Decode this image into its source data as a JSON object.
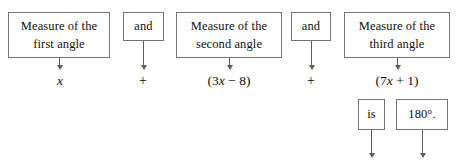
{
  "diagram": {
    "width": 464,
    "height": 162,
    "background_color": "#ffffff",
    "border_color": "#767676",
    "text_color": "#111111",
    "arrow_color": "#5d5d5d"
  },
  "boxes": [
    {
      "id": "first-angle",
      "line1": "Measure of the",
      "line2": "first angle",
      "x": 8,
      "y": 12,
      "w": 102,
      "h": 46
    },
    {
      "id": "and-1",
      "line1": "and",
      "line2": "",
      "x": 123,
      "y": 12,
      "w": 41,
      "h": 29
    },
    {
      "id": "second-angle",
      "line1": "Measure of the",
      "line2": "second angle",
      "x": 176,
      "y": 12,
      "w": 106,
      "h": 46
    },
    {
      "id": "and-2",
      "line1": "and",
      "line2": "",
      "x": 291,
      "y": 12,
      "w": 40,
      "h": 29
    },
    {
      "id": "third-angle",
      "line1": "Measure of the",
      "line2": "third angle",
      "x": 344,
      "y": 12,
      "w": 106,
      "h": 46
    },
    {
      "id": "is",
      "line1": "is",
      "line2": "",
      "x": 358,
      "y": 99,
      "w": 27,
      "h": 31
    },
    {
      "id": "one-eighty",
      "line1": "180°.",
      "line2": "",
      "x": 396,
      "y": 99,
      "w": 52,
      "h": 31
    }
  ],
  "expressions": [
    {
      "id": "x-term",
      "text": "x",
      "italic_html": "<span class=\"var\">x</span>",
      "cx": 60,
      "y": 73
    },
    {
      "id": "plus-1",
      "text": "+",
      "cx": 143,
      "y": 73
    },
    {
      "id": "three-x-minus-eight",
      "text": "(3x − 8)",
      "italic_html": "(3<span class=\"var\">x</span> − 8)",
      "cx": 229,
      "y": 73
    },
    {
      "id": "plus-2",
      "text": "+",
      "cx": 311,
      "y": 73
    },
    {
      "id": "seven-x-plus-one",
      "text": "(7x + 1)",
      "italic_html": "(7<span class=\"var\">x</span> + 1)",
      "cx": 397,
      "y": 73
    }
  ],
  "connectors": [
    {
      "id": "arrow-first-angle",
      "x": 59,
      "y_start": 58,
      "y_end": 70
    },
    {
      "id": "arrow-and-1",
      "x": 143,
      "y_start": 41,
      "y_end": 70
    },
    {
      "id": "arrow-second-angle",
      "x": 229,
      "y_start": 58,
      "y_end": 70
    },
    {
      "id": "arrow-and-2",
      "x": 311,
      "y_start": 41,
      "y_end": 70
    },
    {
      "id": "arrow-third-angle",
      "x": 397,
      "y_start": 58,
      "y_end": 70
    },
    {
      "id": "arrow-is",
      "x": 371,
      "y_start": 130,
      "y_end": 158
    },
    {
      "id": "arrow-one-eighty",
      "x": 422,
      "y_start": 130,
      "y_end": 158
    }
  ],
  "equation_reading": {
    "statement": "x + (3x − 8) + (7x + 1) is 180°.",
    "terms": [
      "x",
      "(3x − 8)",
      "(7x + 1)"
    ],
    "operators": [
      "+",
      "+"
    ],
    "relation": "is",
    "result": "180°."
  }
}
